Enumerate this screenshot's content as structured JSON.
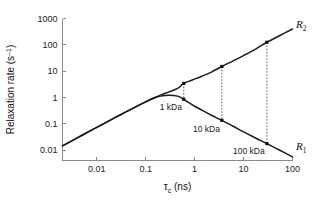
{
  "chart_data": {
    "type": "line",
    "title": "",
    "xlabel": "τc (ns)",
    "xlabel_base": "τ",
    "xlabel_sub": "c",
    "xlabel_unit": " (ns)",
    "ylabel": "Relaxation rate (s⁻¹)",
    "ylabel_base": "Relaxation rate (s",
    "ylabel_sup": "–1",
    "ylabel_close": ")",
    "xscale": "log",
    "yscale": "log",
    "xlim": [
      0.002,
      100
    ],
    "ylim": [
      0.004,
      1000
    ],
    "xticks": [
      0.01,
      0.1,
      1,
      10,
      100
    ],
    "xtick_labels": [
      "0.01",
      "0.1",
      "1",
      "10",
      "100"
    ],
    "yticks": [
      0.01,
      0.1,
      1,
      10,
      100,
      1000
    ],
    "ytick_labels": [
      "0.01",
      "0.1",
      "1",
      "10",
      "100",
      "1000"
    ],
    "grid": false,
    "legend_position": "inline-right",
    "series": [
      {
        "name": "R2",
        "label": "R₂",
        "label_base": "R",
        "label_sub": "2",
        "x": [
          0.002,
          0.004,
          0.008,
          0.015,
          0.03,
          0.06,
          0.1,
          0.15,
          0.2,
          0.3,
          0.45,
          0.6,
          0.9,
          1.4,
          2.2,
          3.6,
          6,
          10,
          18,
          30,
          55,
          100
        ],
        "y": [
          0.0145,
          0.029,
          0.058,
          0.108,
          0.215,
          0.42,
          0.68,
          0.97,
          1.22,
          1.62,
          2.2,
          3.4,
          4.6,
          6.4,
          9.2,
          15.0,
          24.0,
          39.0,
          70.0,
          125.0,
          225.0,
          400.0
        ]
      },
      {
        "name": "R1",
        "label": "R₁",
        "label_base": "R",
        "label_sub": "1",
        "x": [
          0.002,
          0.004,
          0.008,
          0.015,
          0.03,
          0.06,
          0.1,
          0.15,
          0.2,
          0.3,
          0.45,
          0.6,
          0.9,
          1.4,
          2.2,
          3.6,
          6,
          10,
          18,
          30,
          55,
          100
        ],
        "y": [
          0.0145,
          0.029,
          0.058,
          0.108,
          0.215,
          0.42,
          0.68,
          0.95,
          1.12,
          1.22,
          1.12,
          0.85,
          0.52,
          0.33,
          0.21,
          0.135,
          0.082,
          0.049,
          0.028,
          0.0175,
          0.0098,
          0.0055
        ]
      }
    ],
    "annotations": [
      {
        "label": "1 kDa",
        "tau_c": 0.6,
        "r2": 3.4,
        "r1": 0.85,
        "label_x": 0.55,
        "label_y": 0.33
      },
      {
        "label": "10 kDa",
        "tau_c": 3.6,
        "r2": 15.0,
        "r1": 0.135,
        "label_x": 3.3,
        "label_y": 0.048
      },
      {
        "label": "100 kDa",
        "tau_c": 30,
        "r2": 125.0,
        "r1": 0.0175,
        "label_x": 27,
        "label_y": 0.0068
      }
    ]
  },
  "colors": {
    "curve": "#1a1a1a",
    "axis": "#8a8a8a",
    "text": "#222222",
    "connector": "#3a3a3a",
    "background": "#ffffff"
  }
}
